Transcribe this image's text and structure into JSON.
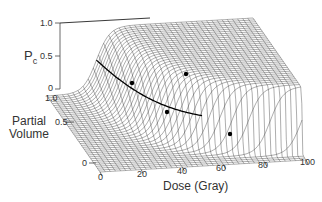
{
  "chart_data": {
    "type": "surface3d",
    "title": "",
    "zlabel": "P_C",
    "ylabel": "Partial Volume",
    "xlabel": "Dose (Gray)",
    "x_ticks": [
      "0",
      "20",
      "40",
      "60",
      "80",
      "100"
    ],
    "y_ticks": [
      "0",
      "0.5",
      "1.0"
    ],
    "z_ticks": [
      "0",
      "0.5",
      "1.0"
    ],
    "xlim": [
      0,
      100
    ],
    "ylim": [
      0,
      1
    ],
    "zlim": [
      0,
      1
    ],
    "iso_points": [
      {
        "dose": 25,
        "volume": 1.0,
        "pc": 0.5
      },
      {
        "dose": 40,
        "volume": 0.55,
        "pc": 0.5
      },
      {
        "dose": 65,
        "volume": 0.25,
        "pc": 0.5
      },
      {
        "dose": 45,
        "volume": 0.85,
        "pc": 0.85
      }
    ],
    "grid": false,
    "legend": null
  },
  "labels": {
    "pc_main": "P",
    "pc_sub": "c",
    "pv_line1": "Partial",
    "pv_line2": "Volume",
    "dose": "Dose (Gray)",
    "z_ticks": [
      "1.0",
      "0.5",
      "0"
    ],
    "y_ticks": [
      "1.0",
      "0.5",
      "0"
    ],
    "x_ticks": [
      "0",
      "20",
      "40",
      "60",
      "80",
      "100"
    ]
  }
}
